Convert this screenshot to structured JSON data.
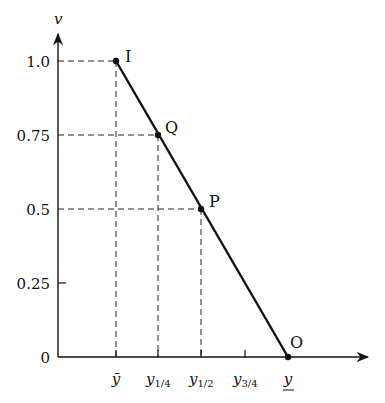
{
  "diagram": {
    "type": "line-diagram",
    "y_axis": {
      "label": "v",
      "ticks": [
        "1.0",
        "0.75",
        "0.5",
        "0.25",
        "0"
      ]
    },
    "x_axis": {
      "ticks": [
        {
          "base": "ȳ",
          "sub": ""
        },
        {
          "base": "y",
          "sub": "1/4"
        },
        {
          "base": "y",
          "sub": "1/2"
        },
        {
          "base": "y",
          "sub": "3/4"
        },
        {
          "base": "y",
          "sub": "",
          "underline": true
        }
      ]
    },
    "points": [
      {
        "label": "I",
        "x": "ȳ",
        "v": 1.0
      },
      {
        "label": "Q",
        "x": "y_1/4",
        "v": 0.75
      },
      {
        "label": "P",
        "x": "y_1/2",
        "v": 0.5
      },
      {
        "label": "O",
        "x": "y̲",
        "v": 0
      }
    ],
    "line_color": "#111111"
  }
}
